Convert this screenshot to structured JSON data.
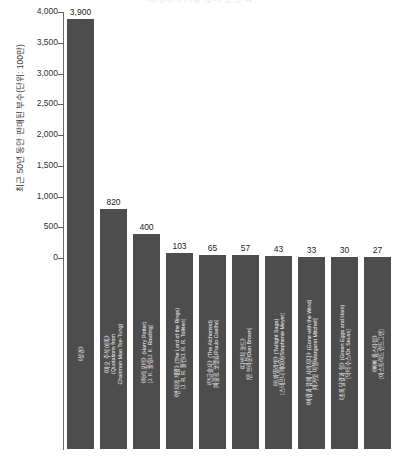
{
  "chart_data": {
    "type": "bar",
    "title": "세계에서 가장 많이 팔린 책",
    "xlabel": "",
    "ylabel": "최근 50년 동안 판매된 부수(단위: 100만)",
    "ylim": [
      0,
      4000
    ],
    "ytick_values": [
      4000,
      3500,
      3000,
      2500,
      2000,
      1500,
      1000,
      500,
      0
    ],
    "ytick_labels": [
      "4,000",
      "3,500",
      "3,000",
      "2,500",
      "2,000",
      "1,500",
      "1,000",
      "500",
      "0"
    ],
    "grid": false,
    "legend": null,
    "bar_color": "#4d4d4d",
    "categories": [
      "《성경》",
      "《마오 주석 어록》(Quotations from Chairman Mao Tse-Tung)",
      "《해리 포터》(Harry Potter) [J. K. 롤링/J. K. Rowling]",
      "《반지의 제왕》(The Lord of the Rings) [J. R. R. 톨킨/J. R. R. Tolkien]",
      "《연금술사》(The Alchemist) [파울로 코엘료/Paulo Coelho]",
      "《다빈치 코드》[댄 브라운/Dan Brown]",
      "《트와일라잇》(Twilight Saga) [스테프니 메이어/Stephenie Meyer]",
      "《바람과 함께 사라지다》(Gone with the Wind) [마거릿 미첼/Margaret Mitchell]",
      "《초록 달걀과 햄》(Green Eggs and Ham) [닥터 수스/Dr. Seuss]",
      "《삐삐 롱스타킹》[아스트리드 린드그렌]"
    ],
    "category_lines": [
      [
        "《성경》"
      ],
      [
        "《마오 주석 어록》",
        "(Quotations from",
        "Chairman Mao Tse-Tung)"
      ],
      [
        "《해리 포터》(Harry Potter)",
        "[J. K. 롤링/J. K. Rowling]"
      ],
      [
        "《반지의 제왕》(The Lord of the Rings)",
        "[J. R. R. 톨킨/J. R. R. Tolkien]"
      ],
      [
        "《연금술사》(The Alchemist)",
        "[파울로 코엘료/Paulo Coelho]"
      ],
      [
        "《다빈치 코드》",
        "[댄 브라운/Dan Brown]"
      ],
      [
        "《트와일라잇》(Twilight Saga)",
        "[스테프니 메이어/Stephenie Meyer]"
      ],
      [
        "《바람과 함께 사라지다》(Gone with the Wind)",
        "[마거릿 미첼/Margaret Mitchell]"
      ],
      [
        "《초록 달걀과 햄》(Green Eggs and Ham)",
        "[닥터 수스/Dr. Seuss]"
      ],
      [
        "《삐삐 롱스타킹》",
        "[아스트리드 린드그렌]"
      ]
    ],
    "values": [
      3900,
      820,
      400,
      103,
      65,
      57,
      43,
      33,
      30,
      27
    ],
    "value_labels": [
      "3,900",
      "820",
      "400",
      "103",
      "65",
      "57",
      "43",
      "33",
      "30",
      "27"
    ]
  }
}
